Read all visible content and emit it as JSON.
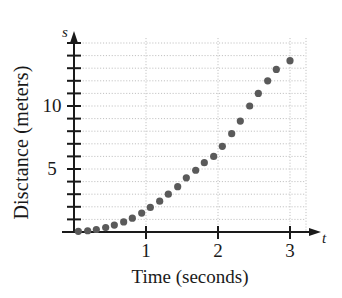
{
  "chart_data": {
    "type": "scatter",
    "title": "",
    "xlabel": "Time (seconds)",
    "ylabel": "Disctance (meters)",
    "x_axis_symbol": "t",
    "y_axis_symbol": "s",
    "xlim": [
      0,
      3.18
    ],
    "ylim": [
      0,
      14.2
    ],
    "xticks": [
      1,
      2,
      3
    ],
    "xtick_labels": [
      "1",
      "2",
      "3"
    ],
    "yticks": [
      5,
      10
    ],
    "ytick_labels": [
      "5",
      "10"
    ],
    "y_minor_ticks": [
      1,
      2,
      3,
      4,
      6,
      7,
      8,
      9,
      11,
      12,
      13,
      14
    ],
    "grid": "dotted horizontal gridlines every 1 meter, dotted vertical gridlines at each second",
    "grid_color": "#b9b9b9",
    "marker_color": "#5a5a5a",
    "marker_size_px": 6,
    "axis_color": "#1a1a1a",
    "legend": null,
    "series": [
      {
        "name": "distance",
        "x": [
          0.06,
          0.19,
          0.31,
          0.44,
          0.56,
          0.69,
          0.81,
          0.94,
          1.06,
          1.19,
          1.31,
          1.44,
          1.56,
          1.69,
          1.81,
          1.94,
          2.06,
          2.19,
          2.31,
          2.44,
          2.56,
          2.69,
          2.81,
          3.0
        ],
        "y": [
          0.05,
          0.1,
          0.2,
          0.35,
          0.55,
          0.8,
          1.1,
          1.5,
          1.95,
          2.45,
          3.0,
          3.6,
          4.3,
          4.9,
          5.5,
          6.0,
          6.8,
          7.8,
          8.8,
          10.0,
          11.0,
          12.0,
          12.9,
          13.6
        ]
      }
    ]
  }
}
